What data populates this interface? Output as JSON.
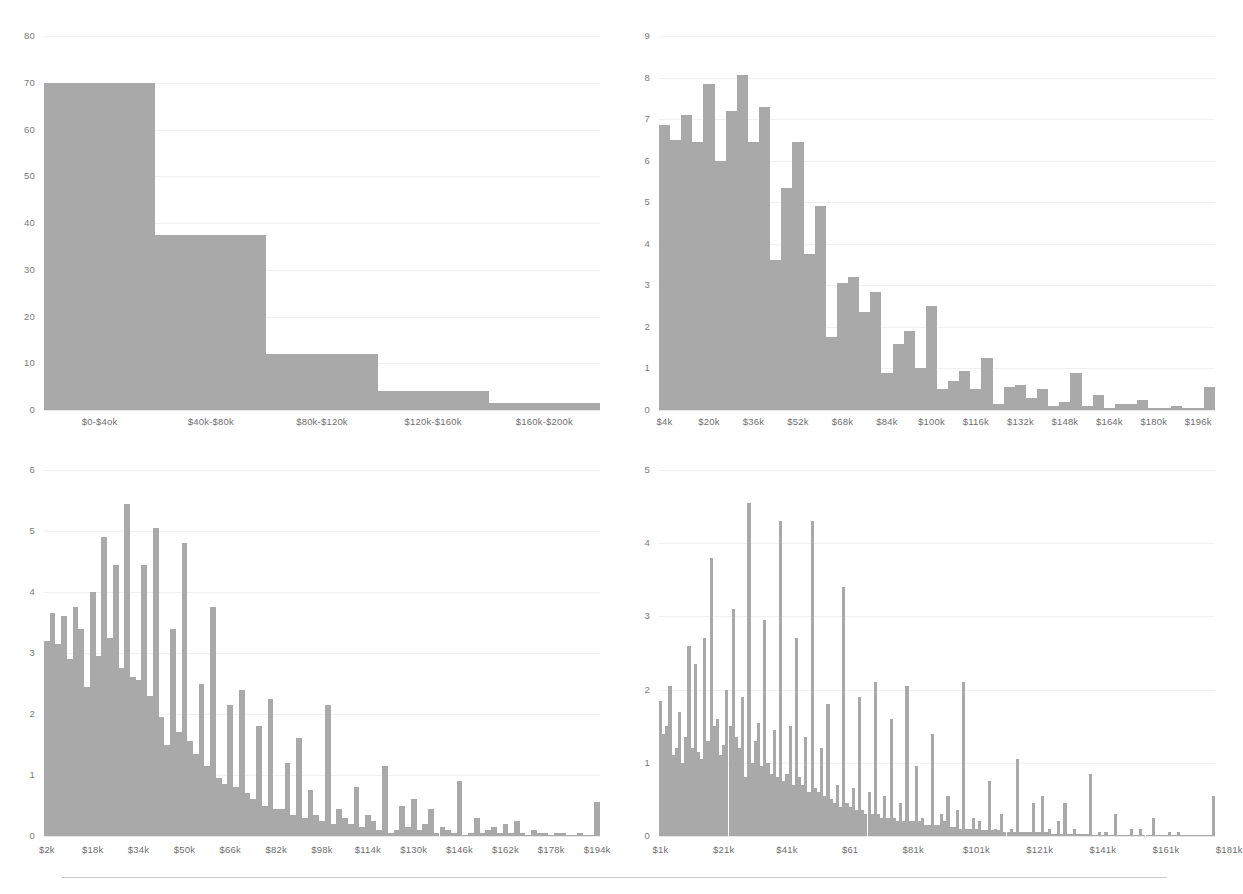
{
  "page": {
    "bar_color": "#a9a9a9",
    "gridline_color": "#f0f0f2",
    "axis_text_color": "#6f6f6f",
    "background": "#ffffff",
    "footer_rule_color": "#c9c9c9"
  },
  "chart_data": [
    {
      "id": "chart-top-left",
      "type": "bar",
      "title": "",
      "xlabel": "",
      "ylabel": "",
      "grid": true,
      "legend": "none",
      "ylim": [
        0,
        80
      ],
      "yticks": [
        0,
        10,
        20,
        30,
        40,
        50,
        60,
        70,
        80
      ],
      "ytick_labels": [
        "0",
        "10",
        "20",
        "30",
        "40",
        "50",
        "60",
        "70",
        "80"
      ],
      "categories": [
        "$0-$4ok",
        "$40k-$80k",
        "$80k-$120k",
        "$120k-$160k",
        "$160k-$200k"
      ],
      "xtick_labels": [
        "$0-$4ok",
        "$40k-$80k",
        "$80k-$120k",
        "$120k-$160k",
        "$160k-$200k"
      ],
      "values": [
        70,
        37.5,
        12,
        4,
        1.5
      ]
    },
    {
      "id": "chart-top-right",
      "type": "bar",
      "title": "",
      "xlabel": "",
      "ylabel": "",
      "grid": true,
      "legend": "none",
      "ylim": [
        0,
        9
      ],
      "yticks": [
        0,
        1,
        2,
        3,
        4,
        5,
        6,
        7,
        8,
        9
      ],
      "ytick_labels": [
        "0",
        "1",
        "2",
        "3",
        "4",
        "5",
        "6",
        "7",
        "8",
        "9"
      ],
      "bin_start": 0,
      "bin_width": 4,
      "bin_unit": "k",
      "xtick_labels": [
        "$4k",
        "$20k",
        "$36k",
        "$52k",
        "$68k",
        "$84k",
        "$100k",
        "$116k",
        "$132k",
        "$148k",
        "$164k",
        "$180k",
        "$196k"
      ],
      "xtick_bins": [
        1,
        5,
        9,
        13,
        17,
        21,
        25,
        29,
        33,
        37,
        41,
        45,
        49
      ],
      "values": [
        6.85,
        6.5,
        7.1,
        6.45,
        7.85,
        6.0,
        7.2,
        8.05,
        6.45,
        7.3,
        3.6,
        5.35,
        6.45,
        3.75,
        4.9,
        1.75,
        3.05,
        3.2,
        2.35,
        2.85,
        0.9,
        1.6,
        1.9,
        1.0,
        2.5,
        0.5,
        0.7,
        0.95,
        0.5,
        1.25,
        0.15,
        0.55,
        0.6,
        0.3,
        0.5,
        0.1,
        0.2,
        0.9,
        0.1,
        0.35,
        0.05,
        0.15,
        0.15,
        0.25,
        0.05,
        0.05,
        0.1,
        0.05,
        0.05,
        0.55
      ]
    },
    {
      "id": "chart-bottom-left",
      "type": "bar",
      "title": "",
      "xlabel": "",
      "ylabel": "",
      "grid": true,
      "legend": "none",
      "ylim": [
        0,
        6
      ],
      "yticks": [
        0,
        1,
        2,
        3,
        4,
        5,
        6
      ],
      "ytick_labels": [
        "0",
        "1",
        "2",
        "3",
        "4",
        "5",
        "6"
      ],
      "bin_start": 0,
      "bin_width": 2,
      "bin_unit": "k",
      "xtick_labels": [
        "$2k",
        "$18k",
        "$34k",
        "$50k",
        "$66k",
        "$82k",
        "$98k",
        "$114k",
        "$130k",
        "$146k",
        "$162k",
        "$178k",
        "$194k"
      ],
      "xtick_bins": [
        1,
        9,
        17,
        25,
        33,
        41,
        49,
        57,
        65,
        73,
        81,
        89,
        97
      ],
      "values": [
        3.2,
        3.65,
        3.15,
        3.6,
        2.9,
        3.75,
        3.4,
        2.45,
        4.0,
        2.95,
        4.9,
        3.25,
        4.45,
        2.75,
        5.45,
        2.6,
        2.55,
        4.45,
        2.3,
        5.05,
        1.95,
        1.5,
        3.4,
        1.7,
        4.8,
        1.55,
        1.35,
        2.5,
        1.15,
        3.75,
        0.95,
        0.85,
        2.15,
        0.8,
        2.4,
        0.7,
        0.6,
        1.8,
        0.5,
        2.25,
        0.45,
        0.45,
        1.2,
        0.35,
        1.6,
        0.3,
        0.75,
        0.35,
        0.25,
        2.15,
        0.2,
        0.45,
        0.3,
        0.2,
        0.8,
        0.15,
        0.35,
        0.25,
        0.1,
        1.15,
        0.05,
        0.1,
        0.5,
        0.15,
        0.6,
        0.1,
        0.2,
        0.45,
        0.05,
        0.15,
        0.1,
        0.05,
        0.9,
        0.02,
        0.05,
        0.3,
        0.05,
        0.1,
        0.15,
        0.05,
        0.2,
        0.05,
        0.25,
        0.05,
        0.02,
        0.1,
        0.05,
        0.05,
        0.02,
        0.05,
        0.05,
        0.02,
        0.02,
        0.05,
        0.02,
        0.02,
        0.55
      ]
    },
    {
      "id": "chart-bottom-right",
      "type": "bar",
      "title": "",
      "xlabel": "",
      "ylabel": "",
      "grid": true,
      "legend": "none",
      "ylim": [
        0,
        5
      ],
      "yticks": [
        0,
        1,
        2,
        3,
        4,
        5
      ],
      "ytick_labels": [
        "0",
        "1",
        "2",
        "3",
        "4",
        "5"
      ],
      "bin_start": 0,
      "bin_width": 1,
      "bin_unit": "k",
      "xtick_labels": [
        "$1k",
        "$21k",
        "$41k",
        "$61",
        "$81k",
        "$101k",
        "$121k",
        "$141k",
        "$161k",
        "$181k"
      ],
      "xtick_bins": [
        1,
        21,
        41,
        61,
        81,
        101,
        121,
        141,
        161,
        181
      ],
      "values": [
        1.85,
        1.4,
        1.5,
        2.05,
        1.1,
        1.2,
        1.7,
        1.0,
        1.35,
        2.6,
        1.2,
        2.35,
        1.15,
        1.05,
        2.7,
        1.3,
        3.8,
        1.5,
        1.6,
        1.1,
        1.25,
        2.0,
        1.5,
        3.1,
        1.35,
        1.2,
        1.9,
        0.8,
        4.55,
        1.0,
        1.3,
        1.55,
        0.95,
        2.95,
        1.0,
        0.85,
        1.45,
        0.8,
        4.3,
        0.75,
        0.85,
        1.5,
        0.7,
        2.7,
        0.8,
        0.7,
        1.35,
        0.6,
        4.3,
        0.65,
        0.6,
        1.2,
        0.55,
        1.8,
        0.5,
        0.45,
        0.7,
        0.4,
        3.4,
        0.45,
        0.4,
        0.65,
        0.35,
        1.9,
        0.35,
        0.3,
        0.6,
        0.3,
        2.1,
        0.3,
        0.25,
        0.55,
        0.25,
        1.6,
        0.25,
        0.2,
        0.45,
        0.2,
        2.05,
        0.2,
        0.2,
        0.95,
        0.2,
        0.25,
        0.15,
        0.15,
        1.4,
        0.15,
        0.15,
        0.3,
        0.2,
        0.55,
        0.12,
        0.12,
        0.35,
        0.1,
        2.1,
        0.1,
        0.1,
        0.25,
        0.1,
        0.2,
        0.08,
        0.08,
        0.75,
        0.08,
        0.1,
        0.08,
        0.3,
        0.05,
        0.05,
        0.1,
        0.05,
        1.05,
        0.05,
        0.05,
        0.05,
        0.05,
        0.45,
        0.05,
        0.05,
        0.55,
        0.05,
        0.1,
        0.03,
        0.03,
        0.2,
        0.03,
        0.45,
        0.03,
        0.03,
        0.1,
        0.03,
        0.03,
        0.03,
        0.03,
        0.85,
        0.02,
        0.02,
        0.05,
        0.02,
        0.05,
        0.02,
        0.02,
        0.3,
        0.02,
        0.02,
        0.02,
        0.02,
        0.1,
        0.02,
        0.02,
        0.1,
        0.02,
        0.02,
        0.02,
        0.25,
        0.02,
        0.02,
        0.02,
        0.02,
        0.05,
        0.02,
        0.02,
        0.05,
        0.02,
        0.02,
        0.02,
        0.02,
        0.02,
        0.02,
        0.02,
        0.02,
        0.02,
        0.02,
        0.55
      ]
    }
  ]
}
